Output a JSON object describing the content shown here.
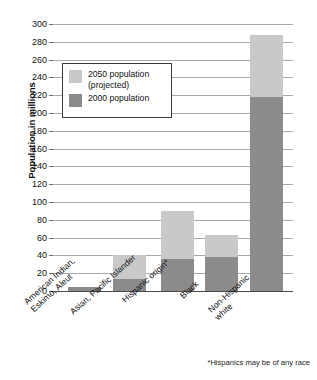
{
  "chart_data": {
    "type": "bar",
    "stacked": true,
    "title": "",
    "subtitle": "",
    "xlabel": "",
    "ylabel": "Population in millions",
    "ylim": [
      0,
      300
    ],
    "ytick_step": 20,
    "yticks": [
      0,
      20,
      40,
      60,
      80,
      100,
      120,
      140,
      160,
      180,
      200,
      220,
      240,
      260,
      280,
      300
    ],
    "grid": true,
    "legend_position": "upper-left-inside",
    "categories": [
      "American Indian,\nEskimo, Aleut",
      "Asian, Pacific Islander",
      "Hispanic origin*",
      "Black",
      "Non-Hispanic\nwhite"
    ],
    "series": [
      {
        "name": "2000 population",
        "color": "#8b8b8b",
        "values": [
          4,
          13,
          36,
          38,
          218
        ]
      },
      {
        "name": "2050 population (projected)",
        "color": "#c9c9c9",
        "values": [
          4,
          41,
          90,
          63,
          288
        ]
      }
    ],
    "annotations": [
      "*Hispanics may be of any race"
    ]
  },
  "axes": {
    "y_title": "Population in millions",
    "y_tick_labels": [
      "300",
      "280",
      "260",
      "240",
      "220",
      "200",
      "180",
      "160",
      "140",
      "120",
      "100",
      "80",
      "60",
      "40",
      "20",
      "0"
    ],
    "x_tick_labels": [
      "American Indian,\nEskimo, Aleut",
      "Asian, Pacific Islander",
      "Hispanic origin*",
      "Black",
      "Non-Hispanic\nwhite"
    ]
  },
  "legend": {
    "items": [
      {
        "label": "2050 population\n(projected)",
        "swatch": "light"
      },
      {
        "label": "2000 population",
        "swatch": "dark"
      }
    ]
  },
  "footnote": {
    "text": "*Hispanics may be of any race"
  },
  "colors": {
    "light_gray": "#c9c9c9",
    "dark_gray": "#8b8b8b",
    "gridline": "#a9a9a9",
    "axis": "#4a4a4a",
    "background": "#ffffff",
    "text": "#111111"
  }
}
